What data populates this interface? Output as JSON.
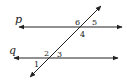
{
  "diagram": {
    "colors": {
      "stroke": "#222222",
      "background": "#ffffff"
    },
    "lines": [
      {
        "id": "p",
        "label": "p",
        "x1": 19,
        "y1": 27,
        "x2": 122,
        "y2": 27,
        "label_x": 15,
        "label_y": 23
      },
      {
        "id": "q",
        "label": "q",
        "x1": 14,
        "y1": 58,
        "x2": 118,
        "y2": 58,
        "label_x": 9,
        "label_y": 54
      },
      {
        "id": "transversal",
        "label": "",
        "x1": 30,
        "y1": 77,
        "x2": 101,
        "y2": 6
      }
    ],
    "angles": [
      {
        "label": "1",
        "x": 34,
        "y": 67
      },
      {
        "label": "2",
        "x": 44,
        "y": 56
      },
      {
        "label": "3",
        "x": 57,
        "y": 57
      },
      {
        "label": "4",
        "x": 80,
        "y": 37
      },
      {
        "label": "5",
        "x": 92,
        "y": 25
      },
      {
        "label": "6",
        "x": 75,
        "y": 25
      }
    ]
  }
}
